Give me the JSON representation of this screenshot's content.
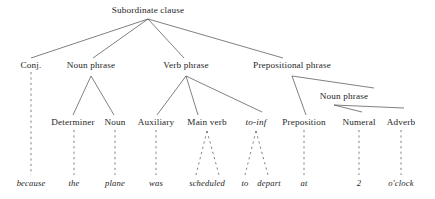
{
  "diagram": {
    "type": "constituency-tree",
    "width": 435,
    "height": 199,
    "background_color": "#ffffff",
    "text_color": "#262626",
    "edge_color": "#4a4a4a"
  },
  "nodes": [
    {
      "id": "root",
      "label": "Subordinate clause",
      "x": 148,
      "y": 11,
      "style": "roman"
    },
    {
      "id": "conj",
      "label": "Conj.",
      "x": 31,
      "y": 66,
      "style": "roman"
    },
    {
      "id": "np1",
      "label": "Noun phrase",
      "x": 91,
      "y": 66,
      "style": "roman"
    },
    {
      "id": "vp",
      "label": "Verb phrase",
      "x": 186,
      "y": 66,
      "style": "roman"
    },
    {
      "id": "pp",
      "label": "Prepositional phrase",
      "x": 292,
      "y": 66,
      "style": "roman"
    },
    {
      "id": "np2",
      "label": "Noun phrase",
      "x": 344,
      "y": 97,
      "style": "roman"
    },
    {
      "id": "determiner",
      "label": "Determiner",
      "x": 73,
      "y": 123,
      "style": "roman"
    },
    {
      "id": "noun",
      "label": "Noun",
      "x": 115,
      "y": 123,
      "style": "roman"
    },
    {
      "id": "auxiliary",
      "label": "Auxiliary",
      "x": 156,
      "y": 123,
      "style": "roman"
    },
    {
      "id": "mainverb",
      "label": "Main verb",
      "x": 207,
      "y": 123,
      "style": "roman"
    },
    {
      "id": "toinf",
      "label": "to-inf",
      "x": 256,
      "y": 123,
      "style": "italic"
    },
    {
      "id": "preposition",
      "label": "Preposition",
      "x": 304,
      "y": 123,
      "style": "roman"
    },
    {
      "id": "numeral",
      "label": "Numeral",
      "x": 359,
      "y": 123,
      "style": "roman"
    },
    {
      "id": "adverb",
      "label": "Adverb",
      "x": 401,
      "y": 123,
      "style": "roman"
    }
  ],
  "leaves": [
    {
      "id": "w-because",
      "label": "because",
      "x": 31,
      "y": 183
    },
    {
      "id": "w-the",
      "label": "the",
      "x": 74,
      "y": 183
    },
    {
      "id": "w-plane",
      "label": "plane",
      "x": 115,
      "y": 183
    },
    {
      "id": "w-was",
      "label": "was",
      "x": 156,
      "y": 183
    },
    {
      "id": "w-scheduled",
      "label": "scheduled",
      "x": 207,
      "y": 183
    },
    {
      "id": "w-to",
      "label": "to",
      "x": 245,
      "y": 183
    },
    {
      "id": "w-depart",
      "label": "depart",
      "x": 269,
      "y": 183
    },
    {
      "id": "w-at",
      "label": "at",
      "x": 304,
      "y": 183
    },
    {
      "id": "w-2",
      "label": "2",
      "x": 359,
      "y": 183
    },
    {
      "id": "w-oclock",
      "label": "o'clock",
      "x": 401,
      "y": 183
    }
  ],
  "sentence": "because the plane was scheduled to depart at 2 o'clock",
  "edges_solid": [
    {
      "from": "root",
      "to": "conj",
      "x1": 148,
      "y1": 19,
      "x2": 31,
      "y2": 58
    },
    {
      "from": "root",
      "to": "np1",
      "x1": 148,
      "y1": 19,
      "x2": 93,
      "y2": 58
    },
    {
      "from": "root",
      "to": "vp",
      "x1": 148,
      "y1": 19,
      "x2": 184,
      "y2": 58
    },
    {
      "from": "root",
      "to": "pp",
      "x1": 148,
      "y1": 19,
      "x2": 283,
      "y2": 58
    },
    {
      "from": "np1",
      "to": "determiner",
      "x1": 91,
      "y1": 76,
      "x2": 73,
      "y2": 115
    },
    {
      "from": "np1",
      "to": "noun",
      "x1": 91,
      "y1": 76,
      "x2": 114,
      "y2": 115
    },
    {
      "from": "vp",
      "to": "auxiliary",
      "x1": 186,
      "y1": 76,
      "x2": 157,
      "y2": 115
    },
    {
      "from": "vp",
      "to": "mainverb",
      "x1": 186,
      "y1": 76,
      "x2": 198,
      "y2": 115
    },
    {
      "from": "vp",
      "to": "toinf",
      "x1": 186,
      "y1": 76,
      "x2": 262,
      "y2": 112
    },
    {
      "from": "pp",
      "to": "preposition",
      "x1": 292,
      "y1": 76,
      "x2": 306,
      "y2": 115
    },
    {
      "from": "pp",
      "to": "np2",
      "x1": 292,
      "y1": 76,
      "x2": 374,
      "y2": 88
    },
    {
      "from": "np2",
      "to": "numeral",
      "x1": 334,
      "y1": 105,
      "x2": 362,
      "y2": 112
    },
    {
      "from": "np2",
      "to": "adverb",
      "x1": 334,
      "y1": 105,
      "x2": 404,
      "y2": 108
    }
  ],
  "edges_dashed": [
    {
      "from": "conj",
      "to": "w-because",
      "x1": 31,
      "y1": 72,
      "x2": 31,
      "y2": 175
    },
    {
      "from": "determiner",
      "to": "w-the",
      "x1": 74,
      "y1": 130,
      "x2": 74,
      "y2": 175
    },
    {
      "from": "noun",
      "to": "w-plane",
      "x1": 115,
      "y1": 130,
      "x2": 115,
      "y2": 175
    },
    {
      "from": "auxiliary",
      "to": "w-was",
      "x1": 156,
      "y1": 130,
      "x2": 156,
      "y2": 175
    },
    {
      "from": "mainverb",
      "to": "w-scheduled-left",
      "x1": 207,
      "y1": 131,
      "x2": 196,
      "y2": 175
    },
    {
      "from": "mainverb",
      "to": "w-scheduled-right",
      "x1": 207,
      "y1": 131,
      "x2": 219,
      "y2": 175
    },
    {
      "from": "toinf",
      "to": "w-to",
      "x1": 256,
      "y1": 131,
      "x2": 245,
      "y2": 175
    },
    {
      "from": "toinf",
      "to": "w-depart",
      "x1": 256,
      "y1": 131,
      "x2": 268,
      "y2": 175
    },
    {
      "from": "preposition",
      "to": "w-at",
      "x1": 304,
      "y1": 130,
      "x2": 304,
      "y2": 175
    },
    {
      "from": "numeral",
      "to": "w-2",
      "x1": 359,
      "y1": 130,
      "x2": 359,
      "y2": 175
    },
    {
      "from": "adverb",
      "to": "w-oclock",
      "x1": 401,
      "y1": 130,
      "x2": 401,
      "y2": 175
    }
  ]
}
